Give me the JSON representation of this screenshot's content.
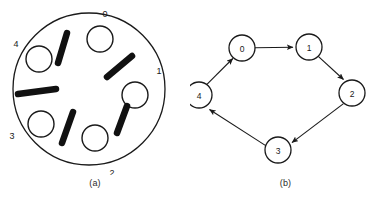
{
  "figure": {
    "panels": [
      {
        "id": "a",
        "caption": "(a)",
        "type": "ring-diagram",
        "description": "Large outer circle containing five small open circles and five thick bars alternating around the circumference",
        "outer_circle": {
          "cx": 89,
          "cy": 89,
          "r": 76
        },
        "position_labels": [
          {
            "text": "0",
            "x": 105,
            "y": 14
          },
          {
            "text": "1",
            "x": 159,
            "y": 71
          },
          {
            "text": "2",
            "x": 112,
            "y": 172
          },
          {
            "text": "3",
            "x": 11,
            "y": 136
          },
          {
            "text": "4",
            "x": 15,
            "y": 44
          }
        ],
        "small_circles": [
          {
            "index": 0,
            "cx": 100,
            "cy": 39,
            "r": 13
          },
          {
            "index": 1,
            "cx": 135,
            "cy": 95,
            "r": 13
          },
          {
            "index": 2,
            "cx": 95,
            "cy": 138,
            "r": 13
          },
          {
            "index": 3,
            "cx": 41,
            "cy": 124,
            "r": 13
          },
          {
            "index": 4,
            "cx": 39,
            "cy": 59,
            "r": 13
          }
        ],
        "bars": [
          {
            "index": 0,
            "x1": 67,
            "y1": 33,
            "x2": 58,
            "y2": 62
          },
          {
            "index": 1,
            "x1": 131,
            "y1": 56,
            "x2": 108,
            "y2": 76
          },
          {
            "index": 2,
            "x1": 126,
            "y1": 107,
            "x2": 116,
            "y2": 132
          },
          {
            "index": 3,
            "x1": 72,
            "y1": 112,
            "x2": 62,
            "y2": 143
          },
          {
            "index": 4,
            "x1": 18,
            "y1": 95,
            "x2": 55,
            "y2": 89
          }
        ]
      },
      {
        "id": "b",
        "caption": "(b)",
        "type": "directed-graph",
        "description": "Directed cycle graph over five nodes",
        "nodes": [
          {
            "label": "0",
            "cx": 52,
            "cy": 48,
            "r": 13
          },
          {
            "label": "1",
            "cx": 119,
            "cy": 47,
            "r": 13
          },
          {
            "label": "2",
            "cx": 162,
            "cy": 93,
            "r": 13
          },
          {
            "label": "3",
            "cx": 88,
            "cy": 150,
            "r": 13
          },
          {
            "label": "4",
            "cx": 9,
            "cy": 95,
            "r": 13
          }
        ],
        "edges": [
          {
            "from": "0",
            "to": "1"
          },
          {
            "from": "1",
            "to": "2"
          },
          {
            "from": "2",
            "to": "3"
          },
          {
            "from": "3",
            "to": "4"
          },
          {
            "from": "4",
            "to": "0"
          }
        ]
      }
    ]
  },
  "colors": {
    "stroke": "#1a1a1a",
    "bar_fill": "#111111",
    "background": "#ffffff"
  }
}
